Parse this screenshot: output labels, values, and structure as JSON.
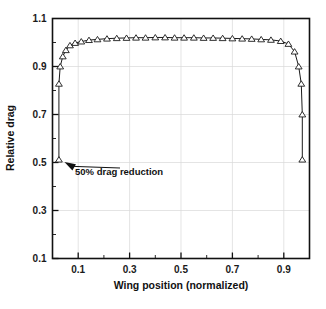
{
  "chart_data": {
    "type": "line",
    "title": "",
    "xlabel": "Wing position (normalized)",
    "ylabel": "Relative drag",
    "xlim": [
      0.0,
      1.0
    ],
    "ylim": [
      0.1,
      1.1
    ],
    "grid": true,
    "legend": null,
    "marker": "open-triangle",
    "x_major_ticks": [
      0.1,
      0.3,
      0.5,
      0.7,
      0.9
    ],
    "x_major_tick_labels": [
      "0.1",
      "0.3",
      "0.5",
      "0.7",
      "0.9"
    ],
    "x_minor_ticks": [
      0.0,
      0.2,
      0.4,
      0.6,
      0.8,
      1.0
    ],
    "y_major_ticks": [
      0.1,
      0.3,
      0.5,
      0.7,
      0.9,
      1.1
    ],
    "y_major_tick_labels": [
      "0.1",
      "0.3",
      "0.5",
      "0.7",
      "0.9",
      "1.1"
    ],
    "y_minor_ticks": [
      0.2,
      0.4,
      0.6,
      0.8,
      1.0
    ],
    "series": [
      {
        "name": "relative drag",
        "x": [
          0.025,
          0.025,
          0.03,
          0.04,
          0.052,
          0.068,
          0.088,
          0.112,
          0.142,
          0.175,
          0.212,
          0.25,
          0.288,
          0.325,
          0.362,
          0.4,
          0.438,
          0.475,
          0.512,
          0.55,
          0.588,
          0.625,
          0.662,
          0.7,
          0.738,
          0.775,
          0.812,
          0.85,
          0.888,
          0.918,
          0.942,
          0.958,
          0.968,
          0.972,
          0.972
        ],
        "y": [
          0.512,
          0.828,
          0.9,
          0.942,
          0.968,
          0.988,
          0.998,
          1.004,
          1.01,
          1.013,
          1.016,
          1.018,
          1.019,
          1.02,
          1.02,
          1.021,
          1.021,
          1.02,
          1.02,
          1.02,
          1.019,
          1.019,
          1.018,
          1.017,
          1.016,
          1.015,
          1.013,
          1.011,
          1.006,
          0.994,
          0.962,
          0.9,
          0.828,
          0.7,
          0.512
        ]
      }
    ],
    "annotations": [
      {
        "text": "50% drag reduction",
        "points_to_x": 0.025,
        "points_to_y": 0.512
      }
    ]
  }
}
